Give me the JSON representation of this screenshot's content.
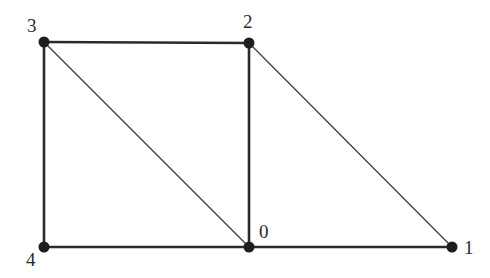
{
  "diagram": {
    "type": "graph",
    "nodes": [
      {
        "id": "0",
        "label": "0",
        "x": 249,
        "y": 247,
        "label_x": 259,
        "label_y": 238
      },
      {
        "id": "1",
        "label": "1",
        "x": 452,
        "y": 247,
        "label_x": 464,
        "label_y": 254
      },
      {
        "id": "2",
        "label": "2",
        "x": 249,
        "y": 43,
        "label_x": 243,
        "label_y": 28
      },
      {
        "id": "3",
        "label": "3",
        "x": 44,
        "y": 42,
        "label_x": 27,
        "label_y": 32
      },
      {
        "id": "4",
        "label": "4",
        "x": 44,
        "y": 247,
        "label_x": 26,
        "label_y": 266
      }
    ],
    "edges": [
      {
        "from": "3",
        "to": "2",
        "style": "thick"
      },
      {
        "from": "3",
        "to": "4",
        "style": "thick"
      },
      {
        "from": "4",
        "to": "0",
        "style": "thick"
      },
      {
        "from": "0",
        "to": "1",
        "style": "thick"
      },
      {
        "from": "2",
        "to": "0",
        "style": "thick"
      },
      {
        "from": "3",
        "to": "0",
        "style": "thin"
      },
      {
        "from": "2",
        "to": "1",
        "style": "thin"
      }
    ]
  }
}
